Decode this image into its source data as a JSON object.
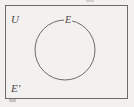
{
  "figure": {
    "kind": "venn-diagram",
    "caption": "",
    "background_color": "#f3f1ef",
    "stroke_color": "#6e6a67",
    "label_color": "#4a4745",
    "universe": {
      "label": "U",
      "shape": "rectangle",
      "x": 5,
      "y": 5,
      "width": 123,
      "height": 94,
      "border_width": 1
    },
    "set": {
      "label": "E",
      "shape": "circle",
      "center_x": 65,
      "center_y": 50,
      "radius": 30,
      "stroke_width": 1,
      "fill": "none"
    },
    "complement": {
      "label": "E'",
      "region": "inside-rectangle-outside-circle"
    },
    "artifacts": {
      "top_tick": "scan-artifact",
      "corner_smudge": "scan-artifact"
    }
  }
}
